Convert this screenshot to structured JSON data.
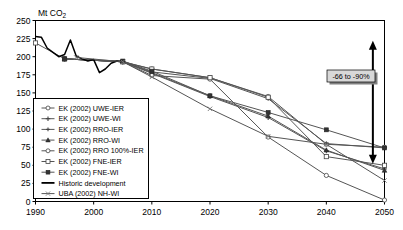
{
  "chart_data": {
    "type": "line",
    "title": "",
    "ylabel": "Mt CO2",
    "ylabel_display": "Mt CO₂",
    "xlabel": "",
    "xlim": [
      1990,
      2050
    ],
    "ylim": [
      0,
      250
    ],
    "ytick_labels": [
      "0",
      "25",
      "50",
      "75",
      "100",
      "125",
      "150",
      "175",
      "200",
      "225",
      "250"
    ],
    "ytick_values": [
      0,
      25,
      50,
      75,
      100,
      125,
      150,
      175,
      200,
      225,
      250
    ],
    "xtick_labels": [
      "1990",
      "2000",
      "2010",
      "2020",
      "2030",
      "2040",
      "2050"
    ],
    "xtick_values": [
      1990,
      2000,
      2010,
      2020,
      2030,
      2040,
      2050
    ],
    "grid": false,
    "legend_position": "lower-left-inside",
    "series": [
      {
        "name": "EK (2002) UWE-IER",
        "marker": "open-circle",
        "x": [
          1995,
          2005,
          2010,
          2020,
          2030,
          2040,
          2050
        ],
        "values": [
          197,
          193,
          183,
          171,
          145,
          79,
          75
        ]
      },
      {
        "name": "EK (2002) UWE-WI",
        "marker": "plus",
        "x": [
          1995,
          2005,
          2010,
          2020,
          2030,
          2040,
          2050
        ],
        "values": [
          197,
          193,
          177,
          145,
          116,
          70,
          45
        ]
      },
      {
        "name": "EK (2002) RRO-IER",
        "marker": "plus-small",
        "x": [
          1995,
          2005,
          2010,
          2020,
          2030,
          2040,
          2050
        ],
        "values": [
          197,
          193,
          179,
          170,
          142,
          80,
          74
        ]
      },
      {
        "name": "EK (2002) RRO-WI",
        "marker": "filled-triangle",
        "x": [
          1995,
          2005,
          2010,
          2020,
          2030,
          2040,
          2050
        ],
        "values": [
          197,
          193,
          178,
          146,
          118,
          71,
          43
        ]
      },
      {
        "name": "EK (2002) RRO 100%-IER",
        "marker": "open-circle",
        "x": [
          1995,
          2005,
          2010,
          2020,
          2030,
          2040,
          2050
        ],
        "values": [
          197,
          193,
          174,
          169,
          89,
          36,
          2
        ]
      },
      {
        "name": "EK (2002) FNE-IER",
        "marker": "open-square",
        "x": [
          1990,
          1995,
          2005,
          2010,
          2020,
          2030,
          2040,
          2050
        ],
        "values": [
          219,
          197,
          193,
          183,
          171,
          144,
          62,
          50
        ]
      },
      {
        "name": "EK (2002) FNE-WI",
        "marker": "filled-square",
        "x": [
          1995,
          2005,
          2010,
          2020,
          2030,
          2040,
          2050
        ],
        "values": [
          197,
          194,
          180,
          146,
          123,
          99,
          74
        ]
      },
      {
        "name": "Historic development",
        "marker": "none",
        "x": [
          1990,
          1991,
          1992,
          1993,
          1994,
          1995,
          1996,
          1997,
          1998,
          1999,
          2000,
          2001,
          2002,
          2003,
          2004,
          2005
        ],
        "values": [
          228,
          227,
          212,
          206,
          200,
          203,
          223,
          201,
          197,
          194,
          196,
          178,
          183,
          191,
          194,
          193
        ]
      },
      {
        "name": "UBA (2002) NH-WI",
        "marker": "x-cross",
        "x": [
          1997,
          2005,
          2010,
          2020,
          2030,
          2040,
          2050
        ],
        "values": [
          199,
          193,
          172,
          128,
          90,
          79,
          29
        ]
      }
    ],
    "annotation": {
      "label": "-66 to -90%",
      "arrow": "double-headed-vertical",
      "arrow_top_value": 222,
      "arrow_bottom_value": 52,
      "arrow_x": 2048
    }
  },
  "legend": {
    "items": [
      {
        "label": "EK (2002) UWE-IER",
        "marker": "open-circle"
      },
      {
        "label": "EK (2002) UWE-WI",
        "marker": "plus"
      },
      {
        "label": "EK (2002) RRO-IER",
        "marker": "plus-small"
      },
      {
        "label": "EK (2002) RRO-WI",
        "marker": "filled-triangle"
      },
      {
        "label": "EK (2002) RRO 100%-IER",
        "marker": "open-circle"
      },
      {
        "label": "EK (2002) FNE-IER",
        "marker": "open-square"
      },
      {
        "label": "EK (2002) FNE-WI",
        "marker": "filled-square"
      },
      {
        "label": "Historic development",
        "marker": "none"
      },
      {
        "label": "UBA (2002) NH-WI",
        "marker": "x-cross"
      }
    ]
  },
  "colors": {
    "axis": "#000000",
    "series_line": "#555555",
    "historic_line": "#000000",
    "annotation_box_fill": "#d8d8d8",
    "annotation_shadow": "#808080",
    "background": "#ffffff"
  }
}
